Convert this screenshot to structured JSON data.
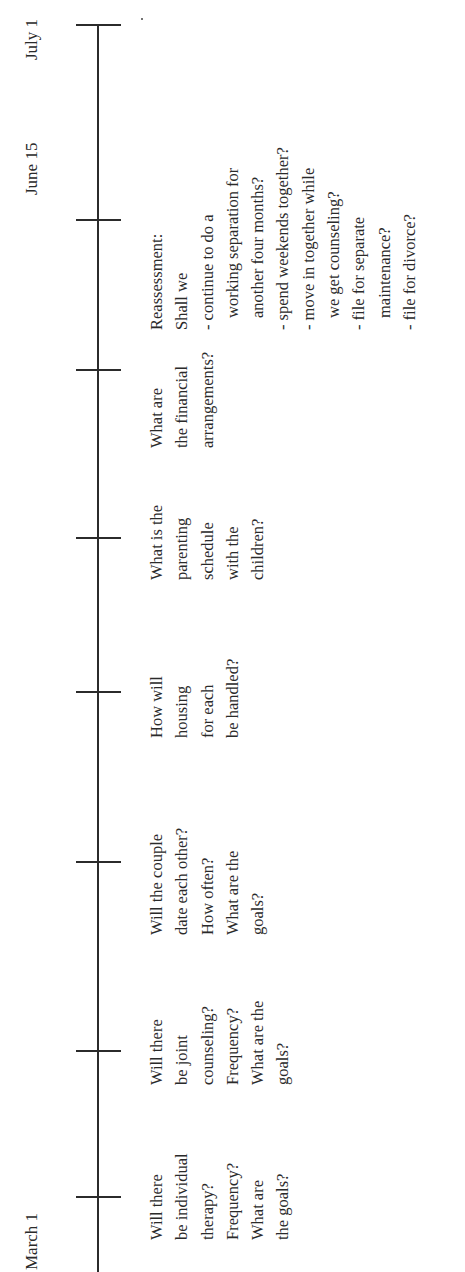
{
  "diagram": {
    "type": "timeline",
    "orientation": "rotated-90-ccw",
    "dates": [
      {
        "label": "March 1",
        "x": 2
      },
      {
        "label": "June 15",
        "x": 1077
      },
      {
        "label": "July 1",
        "x": 1212
      }
    ],
    "ticks": [
      75,
      221,
      410,
      580,
      734,
      902,
      1052,
      1247
    ],
    "columns": [
      {
        "x": 32,
        "lines": [
          "Will there",
          "be individual",
          "therapy?",
          "Frequency?",
          "What are",
          "the goals?"
        ]
      },
      {
        "x": 187,
        "lines": [
          "Will there",
          "be joint",
          "counseling?",
          "Frequency?",
          "What are the",
          "goals?"
        ]
      },
      {
        "x": 337,
        "lines": [
          "Will the couple",
          "date each other?",
          "How often?",
          "What are the",
          "goals?"
        ]
      },
      {
        "x": 534,
        "lines": [
          "How will",
          "housing",
          "for each",
          "be handled?"
        ]
      },
      {
        "x": 692,
        "lines": [
          "What is the",
          "parenting",
          "schedule",
          "with the",
          "children?"
        ]
      },
      {
        "x": 824,
        "lines": [
          "What are",
          "the financial",
          "arrangements?"
        ]
      },
      {
        "x": 942,
        "lines": [
          "Reassessment:",
          "Shall we",
          "- continue to do a",
          "working separation for",
          "another four months?",
          "- spend weekends together?",
          "- move in together while",
          "we get counseling?",
          "- file for separate",
          "maintenance?",
          "- file for divorce?"
        ],
        "indented": [
          3,
          4,
          7,
          9
        ]
      }
    ]
  }
}
